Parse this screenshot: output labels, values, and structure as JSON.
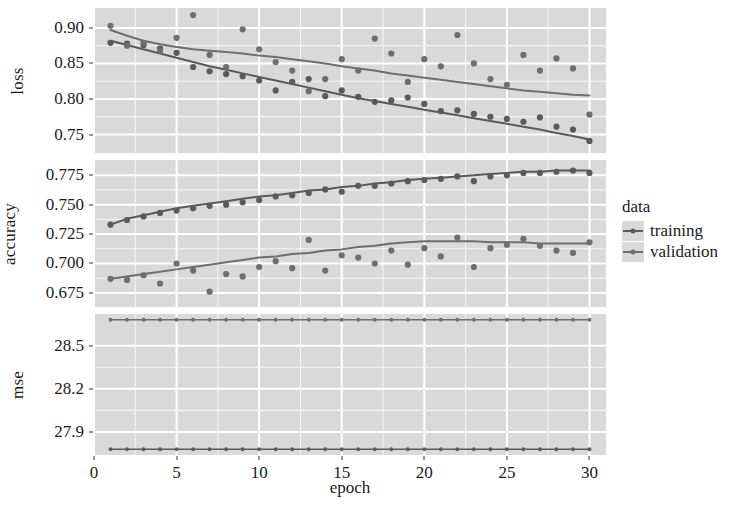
{
  "chart_data": {
    "type": "scatter",
    "title": "",
    "xlabel": "epoch",
    "ylabel": "",
    "grid": true,
    "legend_position": "right",
    "legend_title": "data",
    "legend_entries": [
      "training",
      "validation"
    ],
    "series_colors": {
      "training": "#5a5a5a",
      "validation": "#6e6e6e"
    },
    "panel_background": "#d9d9d9",
    "gridline_color": "#ffffff",
    "x": [
      1,
      2,
      3,
      4,
      5,
      6,
      7,
      8,
      9,
      10,
      11,
      12,
      13,
      14,
      15,
      16,
      17,
      18,
      19,
      20,
      21,
      22,
      23,
      24,
      25,
      26,
      27,
      28,
      29,
      30
    ],
    "xlim": [
      0,
      31
    ],
    "xticks": [
      0,
      5,
      10,
      15,
      20,
      25,
      30
    ],
    "xticklabels": [
      "0",
      "5",
      "10",
      "15",
      "20",
      "25",
      "30"
    ],
    "facets": [
      {
        "name": "loss",
        "ylabel": "loss",
        "ylim": [
          0.724,
          0.928
        ],
        "yticks": [
          0.75,
          0.8,
          0.85,
          0.9
        ],
        "yticklabels": [
          "0.75",
          "0.80",
          "0.85",
          "0.90"
        ],
        "series": [
          {
            "name": "training",
            "values": [
              0.879,
              0.878,
              0.876,
              0.871,
              0.865,
              0.845,
              0.839,
              0.835,
              0.832,
              0.826,
              0.812,
              0.824,
              0.828,
              0.804,
              0.812,
              0.803,
              0.796,
              0.798,
              0.802,
              0.793,
              0.783,
              0.784,
              0.779,
              0.775,
              0.772,
              0.768,
              0.774,
              0.761,
              0.757,
              0.741
            ],
            "smooth": [
              0.882,
              0.876,
              0.87,
              0.864,
              0.858,
              0.852,
              0.846,
              0.841,
              0.836,
              0.831,
              0.826,
              0.821,
              0.816,
              0.811,
              0.806,
              0.801,
              0.797,
              0.793,
              0.789,
              0.785,
              0.781,
              0.777,
              0.773,
              0.769,
              0.765,
              0.761,
              0.757,
              0.752,
              0.748,
              0.743
            ]
          },
          {
            "name": "validation",
            "values": [
              0.903,
              0.875,
              0.879,
              0.868,
              0.886,
              0.918,
              0.862,
              0.845,
              0.898,
              0.87,
              0.852,
              0.84,
              0.811,
              0.828,
              0.856,
              0.84,
              0.885,
              0.864,
              0.824,
              0.856,
              0.846,
              0.89,
              0.85,
              0.828,
              0.82,
              0.862,
              0.84,
              0.857,
              0.843,
              0.778
            ],
            "smooth": [
              0.897,
              0.889,
              0.882,
              0.877,
              0.873,
              0.87,
              0.868,
              0.866,
              0.864,
              0.861,
              0.859,
              0.856,
              0.853,
              0.85,
              0.846,
              0.843,
              0.84,
              0.836,
              0.833,
              0.83,
              0.827,
              0.824,
              0.821,
              0.818,
              0.815,
              0.812,
              0.81,
              0.808,
              0.806,
              0.805
            ]
          }
        ]
      },
      {
        "name": "accuracy",
        "ylabel": "accuracy",
        "ylim": [
          0.663,
          0.788
        ],
        "yticks": [
          0.675,
          0.7,
          0.725,
          0.75,
          0.775
        ],
        "yticklabels": [
          "0.675",
          "0.700",
          "0.725",
          "0.750",
          "0.775"
        ],
        "series": [
          {
            "name": "training",
            "values": [
              0.733,
              0.737,
              0.74,
              0.743,
              0.745,
              0.747,
              0.749,
              0.75,
              0.752,
              0.754,
              0.757,
              0.758,
              0.76,
              0.763,
              0.761,
              0.766,
              0.766,
              0.768,
              0.77,
              0.771,
              0.772,
              0.774,
              0.77,
              0.774,
              0.775,
              0.777,
              0.777,
              0.778,
              0.779,
              0.777
            ],
            "smooth": [
              0.733,
              0.738,
              0.741,
              0.744,
              0.747,
              0.749,
              0.751,
              0.753,
              0.755,
              0.757,
              0.758,
              0.76,
              0.762,
              0.763,
              0.765,
              0.766,
              0.768,
              0.769,
              0.771,
              0.772,
              0.773,
              0.774,
              0.775,
              0.776,
              0.777,
              0.778,
              0.778,
              0.779,
              0.779,
              0.779
            ]
          },
          {
            "name": "validation",
            "values": [
              0.687,
              0.686,
              0.69,
              0.683,
              0.7,
              0.694,
              0.676,
              0.691,
              0.689,
              0.697,
              0.702,
              0.696,
              0.72,
              0.694,
              0.707,
              0.705,
              0.7,
              0.711,
              0.699,
              0.713,
              0.706,
              0.722,
              0.697,
              0.713,
              0.716,
              0.721,
              0.715,
              0.711,
              0.709,
              0.718
            ],
            "smooth": [
              0.687,
              0.689,
              0.691,
              0.693,
              0.695,
              0.697,
              0.699,
              0.701,
              0.703,
              0.705,
              0.706,
              0.708,
              0.709,
              0.711,
              0.712,
              0.714,
              0.715,
              0.717,
              0.718,
              0.719,
              0.719,
              0.719,
              0.719,
              0.718,
              0.718,
              0.718,
              0.717,
              0.717,
              0.717,
              0.717
            ]
          }
        ]
      },
      {
        "name": "mse",
        "ylabel": "mse",
        "ylim": [
          27.74,
          28.72
        ],
        "yticks": [
          27.9,
          28.2,
          28.5
        ],
        "yticklabels": [
          "27.9",
          "28.2",
          "28.5"
        ],
        "series": [
          {
            "name": "training",
            "values": [
              27.78,
              27.78,
              27.78,
              27.78,
              27.78,
              27.78,
              27.78,
              27.78,
              27.78,
              27.78,
              27.78,
              27.78,
              27.78,
              27.78,
              27.78,
              27.78,
              27.78,
              27.78,
              27.78,
              27.78,
              27.78,
              27.78,
              27.78,
              27.78,
              27.78,
              27.78,
              27.78,
              27.78,
              27.78,
              27.78
            ],
            "smooth": [
              27.78,
              27.78,
              27.78,
              27.78,
              27.78,
              27.78,
              27.78,
              27.78,
              27.78,
              27.78,
              27.78,
              27.78,
              27.78,
              27.78,
              27.78,
              27.78,
              27.78,
              27.78,
              27.78,
              27.78,
              27.78,
              27.78,
              27.78,
              27.78,
              27.78,
              27.78,
              27.78,
              27.78,
              27.78,
              27.78
            ]
          },
          {
            "name": "validation",
            "values": [
              28.68,
              28.68,
              28.68,
              28.68,
              28.68,
              28.68,
              28.68,
              28.68,
              28.68,
              28.68,
              28.68,
              28.68,
              28.68,
              28.68,
              28.68,
              28.68,
              28.68,
              28.68,
              28.68,
              28.68,
              28.68,
              28.68,
              28.68,
              28.68,
              28.68,
              28.68,
              28.68,
              28.68,
              28.68,
              28.68
            ],
            "smooth": [
              28.68,
              28.68,
              28.68,
              28.68,
              28.68,
              28.68,
              28.68,
              28.68,
              28.68,
              28.68,
              28.68,
              28.68,
              28.68,
              28.68,
              28.68,
              28.68,
              28.68,
              28.68,
              28.68,
              28.68,
              28.68,
              28.68,
              28.68,
              28.68,
              28.68,
              28.68,
              28.68,
              28.68,
              28.68,
              28.68
            ]
          }
        ]
      }
    ]
  },
  "legend": {
    "title": "data",
    "items": [
      {
        "label": "training"
      },
      {
        "label": "validation"
      }
    ]
  },
  "axes": {
    "x_title": "epoch"
  }
}
